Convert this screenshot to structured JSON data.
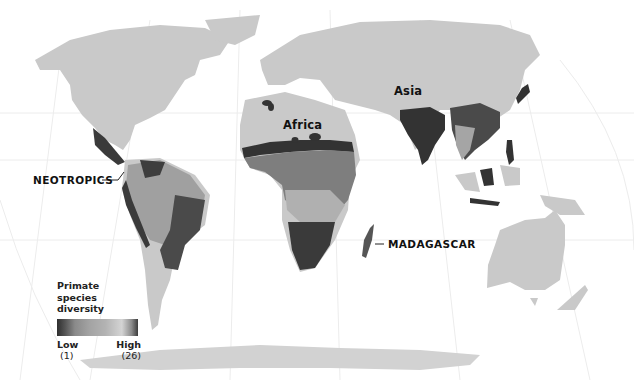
{
  "map": {
    "subject": "Primate species diversity",
    "projection": "world-map",
    "colors": {
      "background": "#ffffff",
      "land": "#c9c9c9",
      "graticule": "#e6e6e6",
      "diversity_low": "#2e2e2e",
      "diversity_mid": "#a3a3a3",
      "diversity_high": "#3c3c3c"
    },
    "region_labels": [
      {
        "id": "africa",
        "text": "Africa"
      },
      {
        "id": "asia",
        "text": "Asia"
      }
    ],
    "callouts": [
      {
        "id": "neotropics",
        "text": "NEOTROPICS"
      },
      {
        "id": "madagascar",
        "text": "MADAGASCAR"
      }
    ]
  },
  "legend": {
    "title_line1": "Primate species",
    "title_line2": "diversity",
    "low_label": "Low",
    "low_value": "(1)",
    "high_label": "High",
    "high_value": "(26)"
  }
}
